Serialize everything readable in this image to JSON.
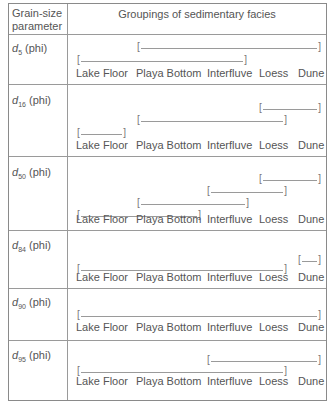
{
  "table": {
    "header": {
      "param_col": "Grain-size parameter",
      "param_col_line1": "Grain-size",
      "param_col_line2": "parameter",
      "facies_col": "Groupings of sedimentary facies"
    },
    "facies_labels": [
      "Lake Floor",
      "Playa Bottom",
      "Interfluve",
      "Loess",
      "Dune"
    ],
    "rows": [
      {
        "param": "d",
        "subscript": "5",
        "unit": "(phi)",
        "groupings": [
          {
            "from": "Playa Bottom",
            "to": "Dune"
          },
          {
            "from": "Lake Floor",
            "to": "Interfluve"
          }
        ]
      },
      {
        "param": "d",
        "subscript": "16",
        "unit": "(phi)",
        "groupings": [
          {
            "from": "Loess",
            "to": "Dune"
          },
          {
            "from": "Playa Bottom",
            "to": "Loess"
          },
          {
            "from": "Lake Floor",
            "to": "Lake Floor"
          }
        ]
      },
      {
        "param": "d",
        "subscript": "50",
        "unit": "(phi)",
        "groupings": [
          {
            "from": "Loess",
            "to": "Dune"
          },
          {
            "from": "Interfluve",
            "to": "Loess"
          },
          {
            "from": "Playa Bottom",
            "to": "Interfluve"
          },
          {
            "from": "Lake Floor",
            "to": "Playa Bottom"
          }
        ]
      },
      {
        "param": "d",
        "subscript": "84",
        "unit": "(phi)",
        "groupings": [
          {
            "from": "Dune",
            "to": "Dune"
          },
          {
            "from": "Lake Floor",
            "to": "Loess"
          }
        ]
      },
      {
        "param": "d",
        "subscript": "90",
        "unit": "(phi)",
        "groupings": [
          {
            "from": "Lake Floor",
            "to": "Dune"
          }
        ]
      },
      {
        "param": "d",
        "subscript": "95",
        "unit": "(phi)",
        "groupings": [
          {
            "from": "Interfluve",
            "to": "Dune"
          },
          {
            "from": "Lake Floor",
            "to": "Loess"
          }
        ]
      }
    ]
  },
  "colors": {
    "border": "#8a8a8a",
    "text": "#555555",
    "bracket": "#9a9a9a"
  }
}
